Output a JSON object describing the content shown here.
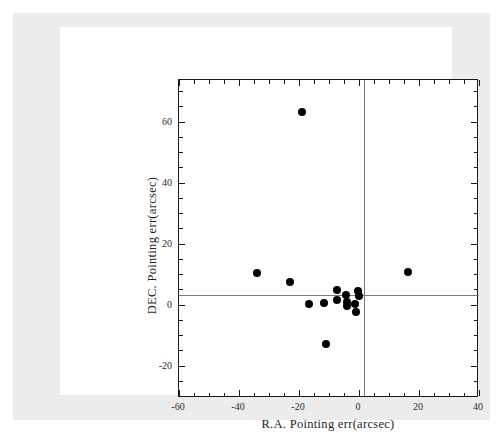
{
  "figure": {
    "background_color": "#ffffff",
    "page_band_color": "#ececed",
    "card_color": "#ffffff",
    "axis_color": "#1a1a1a",
    "zeroline_color": "#7a7a7a",
    "marker_color": "#000000"
  },
  "chart_data": {
    "type": "scatter",
    "title": "",
    "xlabel": "R.A. Pointing err(arcsec)",
    "ylabel": "DEC. Pointing err(arcsec)",
    "xlim": [
      -60,
      40
    ],
    "ylim": [
      -30.6,
      73.6
    ],
    "xticks": [
      -60,
      -40,
      -20,
      0,
      20,
      40
    ],
    "xticklabels": [
      "-60",
      "-40",
      "-20",
      "0",
      "20",
      "40"
    ],
    "yticks": [
      -20,
      0,
      20,
      40,
      60
    ],
    "yticklabels": [
      "-20",
      "0",
      "20",
      "40",
      "60"
    ],
    "x_minor_tick_step": 5,
    "y_minor_tick_step": 5,
    "grid": false,
    "legend": null,
    "reference_lines": [
      {
        "axis": "y",
        "value": 0
      },
      {
        "axis": "x",
        "value": 0
      }
    ],
    "marker": "filled-circle",
    "marker_size_px": 8,
    "n_points": 16,
    "points": [
      {
        "x": -19.0,
        "y": 63.0
      },
      {
        "x": -34.0,
        "y": 10.5
      },
      {
        "x": -23.0,
        "y": 7.5
      },
      {
        "x": 16.4,
        "y": 10.8
      },
      {
        "x": -11.6,
        "y": 0.5
      },
      {
        "x": -7.2,
        "y": 1.5
      },
      {
        "x": -7.2,
        "y": 4.9
      },
      {
        "x": -4.3,
        "y": 3.3
      },
      {
        "x": -4.0,
        "y": 1.0
      },
      {
        "x": -4.0,
        "y": -0.6
      },
      {
        "x": -1.5,
        "y": 0.3
      },
      {
        "x": 0.0,
        "y": 2.9
      },
      {
        "x": -0.3,
        "y": 4.6
      },
      {
        "x": -1.0,
        "y": -2.3
      },
      {
        "x": -16.7,
        "y": 0.3
      },
      {
        "x": -11.0,
        "y": -12.8
      }
    ]
  },
  "artifacts": {
    "top_scan_noise": "     "
  }
}
